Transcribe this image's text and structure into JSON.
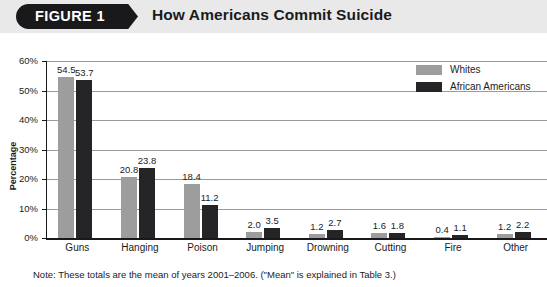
{
  "header": {
    "badge_label": "FIGURE 1",
    "title": "How Americans Commit Suicide",
    "band_color": "#e9e9ea",
    "badge_color": "#19191b"
  },
  "legend": {
    "items": [
      {
        "label": "Whites",
        "color": "#9d9d9d"
      },
      {
        "label": "African Americans",
        "color": "#252527"
      }
    ]
  },
  "note": "Note:  These totals are the mean of years 2001–2006. (\"Mean\" is explained in Table 3.)",
  "axis": {
    "y_title": "Percentage",
    "y_ticks": [
      "0%",
      "10%",
      "20%",
      "30%",
      "40%",
      "50%",
      "60%"
    ]
  },
  "chart_data": {
    "type": "bar",
    "title": "How Americans Commit Suicide",
    "subtitle": "FIGURE 1",
    "xlabel": "",
    "ylabel": "Percentage",
    "ylim": [
      0,
      60
    ],
    "ytick_values": [
      0,
      10,
      20,
      30,
      40,
      50,
      60
    ],
    "ytick_labels": [
      "0%",
      "10%",
      "20%",
      "30%",
      "40%",
      "50%",
      "60%"
    ],
    "grid": true,
    "grid_axis": "y",
    "legend_position": "top-right",
    "categories": [
      "Guns",
      "Hanging",
      "Poison",
      "Jumping",
      "Drowning",
      "Cutting",
      "Fire",
      "Other"
    ],
    "series": [
      {
        "name": "Whites",
        "color": "#9d9d9d",
        "values": [
          54.5,
          20.8,
          18.4,
          2.0,
          1.2,
          1.6,
          0.4,
          1.2
        ],
        "labels": [
          "54.5",
          "20.8",
          "18.4",
          "2.0",
          "1.2",
          "1.6",
          "0.4",
          "1.2"
        ]
      },
      {
        "name": "African Americans",
        "color": "#252527",
        "values": [
          53.7,
          23.8,
          11.2,
          3.5,
          2.7,
          1.8,
          1.1,
          2.2
        ],
        "labels": [
          "53.7",
          "23.8",
          "11.2",
          "3.5",
          "2.7",
          "1.8",
          "1.1",
          "2.2"
        ]
      }
    ],
    "annotation": "Note:  These totals are the mean of years 2001–2006. (\"Mean\" is explained in Table 3.)"
  }
}
